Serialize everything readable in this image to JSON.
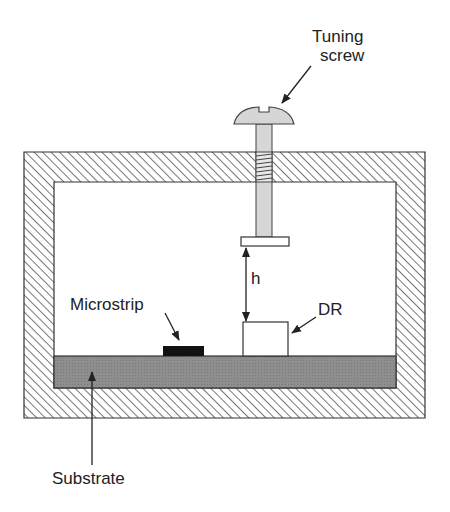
{
  "diagram": {
    "labels": {
      "tuning_screw_line1": "Tuning",
      "tuning_screw_line2": "screw",
      "gap": "h",
      "microstrip": "Microstrip",
      "dr": "DR",
      "substrate": "Substrate"
    },
    "colors": {
      "outline": "#333333",
      "hatch": "#555555",
      "substrate": "#8a8a8a",
      "screw": "#d4d4d4",
      "microstrip": "#111111"
    }
  }
}
